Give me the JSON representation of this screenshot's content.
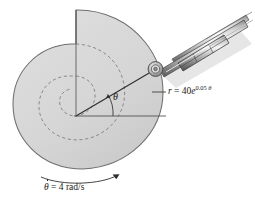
{
  "figure": {
    "labels": {
      "radius_equation_lhs": "r",
      "radius_equation_eq": " = ",
      "radius_equation_coeff": "40",
      "radius_equation_base": "e",
      "radius_equation_exponent_coeff": "0.05",
      "radius_equation_exponent_var": "θ",
      "angle_symbol": "θ",
      "angular_rate_symbol": "θ",
      "angular_rate_eq": " = 4 ",
      "angular_rate_units": "rad/s",
      "angular_rate_full": "θ̇ = 4 rad/s"
    },
    "colors": {
      "cam_fill": "#d7d7d7",
      "cam_stroke": "#6b6b6b",
      "outline": "#3a3a3a",
      "rod_light": "#f2f2f2",
      "rod_mid": "#b9b9b9",
      "rod_dark": "#6e6e6e",
      "shadow": "#cfcfcf",
      "text": "#1a1a1a",
      "dashed": "#7a7a7a",
      "background": "#ffffff"
    },
    "geometry": {
      "cam_center_x": 76,
      "cam_center_y": 116,
      "pin_x": 155,
      "pin_y": 69,
      "datum_line_end_x": 166,
      "spiral_turns": 2,
      "theta_arc_radius": 37
    }
  }
}
